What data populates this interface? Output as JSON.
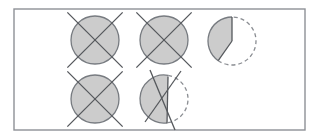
{
  "figure": {
    "canvas": {
      "width": 320,
      "height": 139,
      "background": "#ffffff"
    },
    "frame": {
      "name": "outer-frame",
      "x": 14,
      "y": 9,
      "width": 291,
      "height": 121,
      "stroke": "#8e9196",
      "stroke_width": 1.4,
      "fill": "#ffffff"
    },
    "style": {
      "fill_gray": "#cccccc",
      "outline_gray": "#777b80",
      "line_gray": "#55585c",
      "dash_gray": "#8a8d92",
      "outline_width": 1.3,
      "line_width": 1.3,
      "dash_pattern": "4 3"
    },
    "shapes": [
      {
        "id": "circle-crossed-1",
        "label": "Crossed circle, top left",
        "type": "crossed-circle",
        "cx": 95,
        "cy": 40,
        "r": 24,
        "filled": true,
        "arc_style": "solid",
        "cross": {
          "overhang": 7,
          "lines": [
            {
              "x1": 72.3,
              "y1": 17.3,
              "x2": 117.7,
              "y2": 62.7
            },
            {
              "x1": 117.7,
              "y1": 17.3,
              "x2": 72.3,
              "y2": 62.7
            }
          ]
        }
      },
      {
        "id": "circle-crossed-2",
        "label": "Crossed circle, top middle",
        "type": "crossed-circle",
        "cx": 164,
        "cy": 40,
        "r": 24,
        "filled": true,
        "arc_style": "solid",
        "cross": {
          "overhang": 7,
          "lines": [
            {
              "x1": 141.3,
              "y1": 17.3,
              "x2": 186.7,
              "y2": 62.7
            },
            {
              "x1": 186.7,
              "y1": 17.3,
              "x2": 141.3,
              "y2": 62.7
            }
          ]
        }
      },
      {
        "id": "pie-wedge",
        "label": "Pie wedge with dashed remainder, top right",
        "type": "pie-wedge",
        "cx": 232,
        "cy": 41,
        "r": 24,
        "filled": true,
        "arc_style": "mixed",
        "wedge": {
          "start_angle_deg": 270,
          "end_angle_deg": 125,
          "sweep_direction": "counterclockwise",
          "solid_arc": "from 12 o'clock counterclockwise to about 4-5 o'clock",
          "dashed_arc": "remaining right and bottom portion",
          "radii": [
            {
              "name": "radius-top",
              "x1": 232,
              "y1": 41,
              "x2": 232,
              "y2": 17
            },
            {
              "name": "radius-lower-left",
              "x1": 232,
              "y1": 41,
              "x2": 218.2,
              "y2": 60.6
            }
          ]
        }
      },
      {
        "id": "circle-crossed-3",
        "label": "Crossed circle, bottom left",
        "type": "crossed-circle",
        "cx": 95,
        "cy": 99,
        "r": 24,
        "filled": true,
        "arc_style": "solid",
        "cross": {
          "overhang": 7,
          "lines": [
            {
              "x1": 72.3,
              "y1": 76.3,
              "x2": 117.7,
              "y2": 121.7
            },
            {
              "x1": 117.7,
              "y1": 76.3,
              "x2": 72.3,
              "y2": 121.7
            }
          ]
        }
      },
      {
        "id": "partial-circle-crossed",
        "label": "Partly filled circle with vertical chord, dashed right arc and crossing lines, bottom middle",
        "type": "chord-circle",
        "cx": 164,
        "cy": 99,
        "r": 24,
        "filled": true,
        "arc_style": "mixed",
        "chord": {
          "name": "vertical-chord",
          "x1": 168,
          "y1": 76.5,
          "x2": 167,
          "y2": 123.5
        },
        "solid_arc": "left side of circle from top of chord counterclockwise to bottom of chord",
        "dashed_arc": "right side of circle from top of chord clockwise to bottom of chord",
        "cross_lines": [
          {
            "name": "cross-line-a",
            "x1": 150,
            "y1": 70,
            "x2": 175,
            "y2": 130
          },
          {
            "name": "cross-line-b",
            "x1": 181,
            "y1": 71,
            "x2": 145,
            "y2": 122
          }
        ]
      }
    ]
  }
}
